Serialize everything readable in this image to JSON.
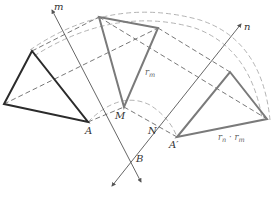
{
  "diagram": {
    "labels": {
      "m": "m",
      "n": "n",
      "A": "A",
      "M": "M",
      "N": "N",
      "B": "B",
      "A_prime": "A′",
      "r_m": "r",
      "r_m_sub": "m",
      "composite_r_n": "r",
      "composite_r_n_sub": "n",
      "composite_dot": " · ",
      "composite_r_m": "r",
      "composite_r_m_sub": "m"
    },
    "colors": {
      "original_triangle": "#2b2b2b",
      "image_triangles": "#7a7a7a",
      "mirror_lines": "#555555",
      "dashed_paths": "#555555",
      "arcs": "#aaaaaa"
    },
    "triangles": [
      {
        "name": "original",
        "points": [
          [
            32,
            51
          ],
          [
            4,
            104
          ],
          [
            88,
            122
          ]
        ]
      },
      {
        "name": "reflection-in-m",
        "points": [
          [
            99,
            17
          ],
          [
            158,
            28
          ],
          [
            124,
            107
          ]
        ]
      },
      {
        "name": "reflection-in-n",
        "points": [
          [
            230,
            72
          ],
          [
            267,
            119
          ],
          [
            177,
            137
          ]
        ]
      }
    ],
    "mirror_lines": [
      {
        "name": "m",
        "from": [
          141,
          182
        ],
        "to": [
          52,
          10
        ]
      },
      {
        "name": "n",
        "from": [
          112,
          186
        ],
        "to": [
          241,
          24
        ]
      }
    ]
  }
}
